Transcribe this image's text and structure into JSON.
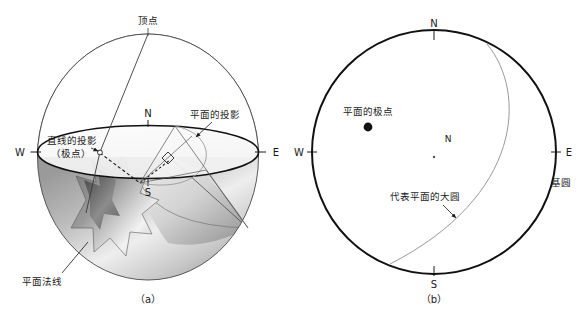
{
  "figure": {
    "title_absent": true,
    "panels": [
      {
        "id": "a",
        "caption": "（a）",
        "type": "sphere-projection-3d",
        "compass": {
          "n": "N",
          "s": "S",
          "e": "E",
          "w": "W"
        },
        "labels": {
          "apex": "顶点",
          "line_projection": "直线的投影",
          "line_projection_second": "（极点）",
          "plane_projection": "平面的投影",
          "plane_normal": "平面法线"
        }
      },
      {
        "id": "b",
        "caption": "（b）",
        "type": "stereonet-2d",
        "compass": {
          "n": "N",
          "s": "S",
          "e": "E",
          "w": "W"
        },
        "center_label": "N",
        "labels": {
          "plane_pole": "平面的极点",
          "great_circle": "代表平面的大圆",
          "primitive_circle": "基圆"
        }
      }
    ],
    "colors": {
      "stroke": "#1a1a1a",
      "thin_stroke": "#555555",
      "arc_gray": "#8c8c8c",
      "shade_dark": "#6b6b6b",
      "shade_mid": "#a8a8a8",
      "shade_light": "#e2e2e2",
      "background": "#ffffff"
    }
  }
}
